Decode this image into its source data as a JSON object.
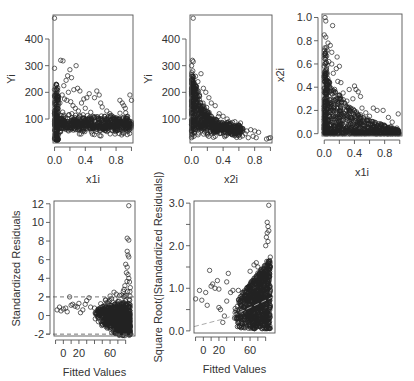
{
  "chart_data": [
    {
      "id": "p1",
      "type": "scatter",
      "title": "",
      "xlabel": "x1i",
      "ylabel": "Yi",
      "xlim": [
        -0.02,
        1.02
      ],
      "ylim": [
        10,
        490
      ],
      "xticks": [
        0.0,
        0.2,
        0.4,
        0.6,
        0.8,
        1.0
      ],
      "xtick_labels": [
        "0.0",
        "",
        "0.4",
        "",
        "0.8",
        ""
      ],
      "yticks": [
        100,
        200,
        300,
        400
      ],
      "ytick_labels": [
        "100",
        "200",
        "300",
        "400"
      ],
      "frame": {
        "x": 53,
        "y": 15,
        "w": 80,
        "h": 128
      },
      "points": [
        [
          0.0,
          478
        ],
        [
          0.0,
          290
        ],
        [
          0.08,
          320
        ],
        [
          0.11,
          318
        ],
        [
          0.28,
          300
        ],
        [
          0.2,
          285
        ],
        [
          0.17,
          262
        ],
        [
          0.22,
          255
        ],
        [
          0.15,
          245
        ],
        [
          0.12,
          225
        ],
        [
          0.25,
          210
        ],
        [
          0.18,
          200
        ],
        [
          0.3,
          215
        ],
        [
          0.33,
          205
        ],
        [
          0.38,
          175
        ],
        [
          0.42,
          180
        ],
        [
          0.45,
          195
        ],
        [
          0.55,
          205
        ],
        [
          0.58,
          190
        ],
        [
          0.52,
          180
        ],
        [
          0.6,
          160
        ],
        [
          0.62,
          145
        ],
        [
          0.68,
          130
        ],
        [
          0.72,
          120
        ],
        [
          0.85,
          170
        ],
        [
          0.88,
          160
        ],
        [
          0.9,
          150
        ],
        [
          0.92,
          140
        ],
        [
          0.98,
          190
        ],
        [
          1.0,
          170
        ],
        [
          0.05,
          180
        ],
        [
          0.07,
          160
        ],
        [
          0.1,
          190
        ],
        [
          0.13,
          175
        ],
        [
          0.16,
          170
        ],
        [
          0.21,
          165
        ],
        [
          0.24,
          150
        ],
        [
          0.27,
          140
        ],
        [
          0.31,
          130
        ],
        [
          0.35,
          160
        ],
        [
          0.4,
          140
        ],
        [
          0.47,
          125
        ],
        [
          0.5,
          110
        ],
        [
          0.56,
          100
        ],
        [
          0.65,
          110
        ],
        [
          0.75,
          100
        ],
        [
          0.8,
          105
        ],
        [
          0.95,
          110
        ],
        [
          0.02,
          230
        ],
        [
          0.01,
          220
        ],
        [
          0.03,
          200
        ],
        [
          0.0,
          210
        ]
      ],
      "dense_band": {
        "x_range": [
          0.0,
          1.0
        ],
        "y_center": 80,
        "y_spread": 25,
        "count": 600
      },
      "dense_column": {
        "x_range": [
          0.0,
          0.05
        ],
        "y_range": [
          20,
          230
        ],
        "count": 150
      },
      "ref_lines": []
    },
    {
      "id": "p2",
      "type": "scatter",
      "xlabel": "x2i",
      "ylabel": "Yi",
      "xlim": [
        -0.02,
        1.02
      ],
      "ylim": [
        10,
        490
      ],
      "xticks": [
        0.0,
        0.2,
        0.4,
        0.6,
        0.8,
        1.0
      ],
      "xtick_labels": [
        "0.0",
        "",
        "0.4",
        "",
        "0.8",
        ""
      ],
      "yticks": [
        100,
        200,
        300,
        400
      ],
      "ytick_labels": [
        "100",
        "200",
        "300",
        "400"
      ],
      "frame": {
        "x": 190,
        "y": 15,
        "w": 82,
        "h": 128
      },
      "points": [
        [
          0.02,
          478
        ],
        [
          0.01,
          320
        ],
        [
          0.02,
          315
        ],
        [
          0.0,
          300
        ],
        [
          0.12,
          270
        ],
        [
          0.05,
          260
        ],
        [
          0.08,
          240
        ],
        [
          0.15,
          215
        ],
        [
          0.22,
          180
        ],
        [
          0.18,
          200
        ],
        [
          0.1,
          190
        ],
        [
          0.25,
          160
        ],
        [
          0.3,
          150
        ],
        [
          0.35,
          120
        ],
        [
          0.4,
          110
        ],
        [
          0.45,
          100
        ],
        [
          0.55,
          90
        ],
        [
          0.62,
          85
        ],
        [
          0.65,
          60
        ],
        [
          0.7,
          55
        ],
        [
          0.75,
          60
        ],
        [
          0.8,
          55
        ],
        [
          0.85,
          50
        ],
        [
          0.72,
          30
        ],
        [
          0.78,
          35
        ],
        [
          0.82,
          30
        ],
        [
          0.95,
          25
        ],
        [
          0.98,
          28
        ],
        [
          1.0,
          30
        ],
        [
          0.68,
          45
        ],
        [
          0.6,
          50
        ],
        [
          0.58,
          40
        ],
        [
          0.5,
          45
        ],
        [
          0.0,
          30
        ],
        [
          0.03,
          35
        ],
        [
          0.2,
          40
        ],
        [
          0.3,
          35
        ]
      ],
      "dense_decay": {
        "a": 250,
        "k": 6.0,
        "base": 55,
        "count": 700
      },
      "ref_lines": []
    },
    {
      "id": "p3",
      "type": "scatter",
      "xlabel": "x1i",
      "ylabel": "x2i",
      "xlim": [
        -0.03,
        1.03
      ],
      "ylim": [
        -0.02,
        1.03
      ],
      "xticks": [
        0.0,
        0.2,
        0.4,
        0.6,
        0.8,
        1.0
      ],
      "xtick_labels": [
        "0.0",
        "",
        "0.4",
        "",
        "0.8",
        ""
      ],
      "yticks": [
        0.0,
        0.2,
        0.4,
        0.6,
        0.8,
        1.0
      ],
      "ytick_labels": [
        "0.0",
        "0.2",
        "0.4",
        "0.6",
        "0.8",
        "1.0"
      ],
      "frame": {
        "x": 322,
        "y": 14,
        "w": 80,
        "h": 122
      },
      "points": [
        [
          0.01,
          1.0
        ],
        [
          0.02,
          0.97
        ],
        [
          0.11,
          0.93
        ],
        [
          0.0,
          0.85
        ],
        [
          0.02,
          0.83
        ],
        [
          0.05,
          0.78
        ],
        [
          0.08,
          0.76
        ],
        [
          0.1,
          0.7
        ],
        [
          0.02,
          0.7
        ],
        [
          0.0,
          0.65
        ],
        [
          0.17,
          0.66
        ],
        [
          0.2,
          0.58
        ],
        [
          0.16,
          0.56
        ],
        [
          0.12,
          0.52
        ],
        [
          0.1,
          0.6
        ],
        [
          0.06,
          0.62
        ],
        [
          0.18,
          0.45
        ],
        [
          0.22,
          0.44
        ],
        [
          0.25,
          0.35
        ],
        [
          0.33,
          0.38
        ],
        [
          0.4,
          0.41
        ],
        [
          0.42,
          0.38
        ],
        [
          0.45,
          0.36
        ],
        [
          0.48,
          0.32
        ],
        [
          0.38,
          0.3
        ],
        [
          0.3,
          0.28
        ],
        [
          0.5,
          0.22
        ],
        [
          0.55,
          0.18
        ],
        [
          0.65,
          0.22
        ],
        [
          0.7,
          0.2
        ],
        [
          0.78,
          0.2
        ],
        [
          0.85,
          0.14
        ],
        [
          0.98,
          0.17
        ],
        [
          0.9,
          0.1
        ],
        [
          0.6,
          0.15
        ],
        [
          0.35,
          0.22
        ],
        [
          0.28,
          0.24
        ],
        [
          0.05,
          0.45
        ],
        [
          0.03,
          0.55
        ]
      ],
      "dense_triangle": {
        "count": 800
      },
      "ref_lines": []
    },
    {
      "id": "p4",
      "type": "scatter",
      "xlabel": "Fitted Values",
      "ylabel": "Standardized Residuals",
      "xlim": [
        -12,
        92
      ],
      "ylim": [
        -2.2,
        12.3
      ],
      "xticks": [
        -10,
        0,
        10,
        20,
        30,
        40,
        50,
        60,
        70,
        80
      ],
      "xtick_labels": [
        "",
        "0",
        "",
        "20",
        "",
        "",
        "",
        "60",
        "",
        ""
      ],
      "yticks": [
        -2,
        0,
        2,
        4,
        6,
        8,
        10,
        12
      ],
      "ytick_labels": [
        "-2",
        "0",
        "2",
        "4",
        "6",
        "8",
        "10",
        "12"
      ],
      "frame": {
        "x": 54,
        "y": 201,
        "w": 81,
        "h": 135
      },
      "points": [
        [
          -8,
          0.6
        ],
        [
          -5,
          0.9
        ],
        [
          -3,
          0.5
        ],
        [
          0,
          0.7
        ],
        [
          3,
          0.8
        ],
        [
          5,
          0.4
        ],
        [
          8,
          2.0
        ],
        [
          10,
          1.1
        ],
        [
          12,
          1.2
        ],
        [
          15,
          1.0
        ],
        [
          18,
          0.9
        ],
        [
          20,
          1.3
        ],
        [
          22,
          0.3
        ],
        [
          25,
          0.6
        ],
        [
          28,
          1.2
        ],
        [
          30,
          1.6
        ],
        [
          33,
          1.9
        ],
        [
          35,
          0.9
        ],
        [
          40,
          0.8
        ],
        [
          45,
          0.7
        ],
        [
          50,
          0.6
        ],
        [
          55,
          0.9
        ],
        [
          60,
          2.1
        ],
        [
          62,
          1.8
        ],
        [
          65,
          2.5
        ],
        [
          68,
          2.3
        ],
        [
          70,
          1.5
        ],
        [
          75,
          2.2
        ],
        [
          84,
          11.8
        ],
        [
          82,
          8.3
        ],
        [
          84,
          8.1
        ],
        [
          82,
          6.9
        ],
        [
          83,
          6.5
        ],
        [
          84,
          6.3
        ],
        [
          80,
          5.5
        ],
        [
          82,
          5.2
        ],
        [
          81,
          4.6
        ],
        [
          83,
          4.4
        ],
        [
          84,
          4.0
        ],
        [
          85,
          3.6
        ],
        [
          86,
          3.0
        ],
        [
          79,
          3.2
        ],
        [
          78,
          2.8
        ],
        [
          77,
          2.6
        ]
      ],
      "dense_funnel": {
        "count": 900
      },
      "ref_lines": [
        {
          "y": 2
        },
        {
          "y": -2
        }
      ]
    },
    {
      "id": "p5",
      "type": "scatter",
      "xlabel": "Fitted Values",
      "ylabel": "Square Root(|Standardized Residuals|)",
      "xlim": [
        -12,
        92
      ],
      "ylim": [
        -0.05,
        3.05
      ],
      "xticks": [
        -10,
        0,
        10,
        20,
        30,
        40,
        50,
        60,
        70,
        80
      ],
      "xtick_labels": [
        "",
        "0",
        "",
        "20",
        "",
        "",
        "",
        "60",
        "",
        ""
      ],
      "yticks": [
        0.0,
        0.5,
        1.0,
        1.5,
        2.0,
        2.5,
        3.0
      ],
      "ytick_labels": [
        "0.0",
        "",
        "1.0",
        "",
        "2.0",
        "",
        "3.0"
      ],
      "frame": {
        "x": 194,
        "y": 201,
        "w": 81,
        "h": 132
      },
      "points": [
        [
          84,
          2.95
        ],
        [
          82,
          2.55
        ],
        [
          83,
          2.45
        ],
        [
          84,
          2.35
        ],
        [
          82,
          2.3
        ],
        [
          81,
          2.2
        ],
        [
          83,
          2.1
        ],
        [
          80,
          2.0
        ],
        [
          -10,
          0.75
        ],
        [
          -5,
          0.95
        ],
        [
          -2,
          0.72
        ],
        [
          3,
          0.9
        ],
        [
          5,
          0.6
        ],
        [
          8,
          1.42
        ],
        [
          10,
          1.05
        ],
        [
          12,
          1.1
        ],
        [
          15,
          1.0
        ],
        [
          18,
          1.18
        ],
        [
          20,
          0.98
        ],
        [
          20,
          0.55
        ],
        [
          22,
          0.5
        ],
        [
          25,
          0.2
        ],
        [
          27,
          0.35
        ],
        [
          30,
          1.15
        ],
        [
          32,
          1.35
        ],
        [
          30,
          0.7
        ],
        [
          35,
          0.9
        ],
        [
          38,
          0.95
        ],
        [
          40,
          0.3
        ],
        [
          45,
          0.95
        ],
        [
          50,
          0.9
        ],
        [
          55,
          0.95
        ],
        [
          60,
          1.4
        ],
        [
          65,
          1.55
        ],
        [
          68,
          1.6
        ],
        [
          70,
          1.5
        ],
        [
          72,
          1.3
        ],
        [
          75,
          1.1
        ]
      ],
      "dense_funnel": {
        "count": 900
      },
      "smooth_line": [
        [
          -12,
          0.1
        ],
        [
          30,
          0.3
        ],
        [
          60,
          0.55
        ],
        [
          90,
          0.8
        ]
      ],
      "ref_lines": []
    }
  ]
}
